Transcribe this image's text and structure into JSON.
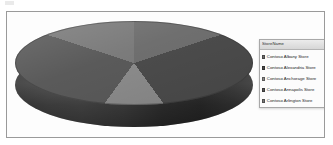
{
  "chart": {
    "frame_border_color": "#9a9a9a",
    "background": "#ffffff"
  },
  "legend": {
    "title": "StoreName",
    "filter_icon": "filter-icon",
    "items": [
      {
        "label": "Contoso Albany Store",
        "color": "#6f6f6f"
      },
      {
        "label": "Contoso Alexandria Store",
        "color": "#4c4c4c"
      },
      {
        "label": "Contoso Anchorage Store",
        "color": "#8c8c8c"
      },
      {
        "label": "Contoso Annapolis Store",
        "color": "#5a5a5a"
      },
      {
        "label": "Contoso Arlington Store",
        "color": "#7b7b7b"
      }
    ]
  },
  "chart_data": {
    "type": "pie",
    "title": "",
    "legend_position": "right",
    "three_d": true,
    "categories": [
      "Contoso Albany Store",
      "Contoso Alexandria Store",
      "Contoso Anchorage Store",
      "Contoso Annapolis Store",
      "Contoso Arlington Store"
    ],
    "values": [
      20,
      20,
      20,
      20,
      20
    ],
    "percentages": [
      20,
      20,
      20,
      20,
      20
    ],
    "colors": [
      "#6f6f6f",
      "#4c4c4c",
      "#8c8c8c",
      "#5a5a5a",
      "#7b7b7b"
    ],
    "start_angle": 0,
    "xlabel": "",
    "ylabel": ""
  }
}
